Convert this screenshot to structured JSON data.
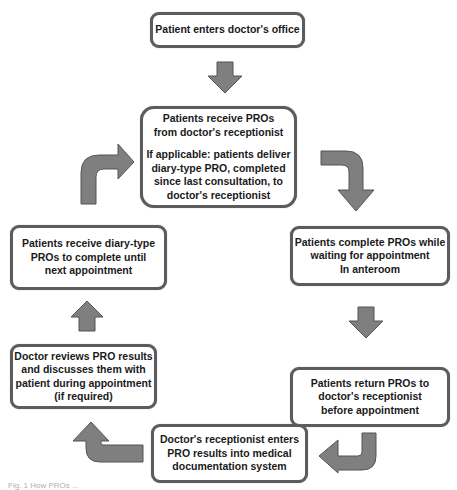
{
  "diagram": {
    "steps": {
      "enter_office": {
        "lines": [
          "Patient enters doctor's office"
        ]
      },
      "receive_pros": {
        "lines": [
          "Patients receive PROs",
          "from doctor's receptionist"
        ],
        "note_lines": [
          "If applicable: patients deliver",
          "diary-type PRO, completed",
          "since last consultation, to",
          "doctor's receptionist"
        ]
      },
      "complete_pros": {
        "lines": [
          "Patients complete PROs while",
          "waiting for appointment",
          "In anteroom"
        ]
      },
      "return_pros": {
        "lines": [
          "Patients return PROs to",
          "doctor's receptionist",
          "before appointment"
        ]
      },
      "receptionist_enters": {
        "lines": [
          "Doctor's receptionist enters",
          "PRO results into medical",
          "documentation system"
        ]
      },
      "doctor_reviews": {
        "lines": [
          "Doctor reviews PRO results",
          "and discusses them with",
          "patient during appointment",
          "(if required)"
        ]
      },
      "receive_diary": {
        "lines": [
          "Patients receive diary-type",
          "PROs to complete until",
          "next appointment"
        ]
      }
    },
    "arrows": [
      {
        "from": "enter_office",
        "to": "receive_pros",
        "shape": "arrow-down"
      },
      {
        "from": "receive_pros",
        "to": "complete_pros",
        "shape": "curved-arrow-right-down"
      },
      {
        "from": "complete_pros",
        "to": "return_pros",
        "shape": "arrow-down"
      },
      {
        "from": "return_pros",
        "to": "receptionist_enters",
        "shape": "curved-arrow-down-left"
      },
      {
        "from": "receptionist_enters",
        "to": "doctor_reviews",
        "shape": "curved-arrow-left-up"
      },
      {
        "from": "doctor_reviews",
        "to": "receive_diary",
        "shape": "arrow-up"
      },
      {
        "from": "receive_diary",
        "to": "receive_pros",
        "shape": "curved-arrow-up-right"
      }
    ],
    "colors": {
      "box_border": "#5c5c5c",
      "arrow_fill": "#7f7f7f",
      "text": "#1a1a1a"
    }
  },
  "caption": "Fig. 1 How PROs ..."
}
